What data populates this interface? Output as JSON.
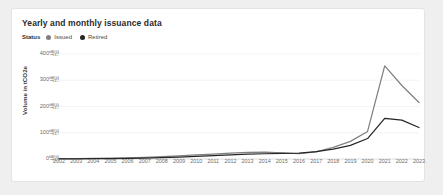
{
  "card": {
    "title": "Yearly and monthly issuance data"
  },
  "legend": {
    "title": "Status",
    "items": [
      {
        "label": "Issued",
        "color": "#808080"
      },
      {
        "label": "Retired",
        "color": "#262626"
      }
    ]
  },
  "chart_data": {
    "type": "line",
    "title": "Yearly and monthly issuance data",
    "xlabel": "",
    "ylabel": "Volume in tCO2e",
    "xlim": [
      2002,
      2023
    ],
    "ylim": [
      0,
      400000000
    ],
    "grid": true,
    "legend_position": "top-left",
    "ytick_labels": [
      "0백만",
      "100백만",
      "200백만",
      "300백만",
      "400백만"
    ],
    "ytick_values": [
      0,
      100000000,
      200000000,
      300000000,
      400000000
    ],
    "categories": [
      "2002",
      "2003",
      "2004",
      "2005",
      "2006",
      "2007",
      "2008",
      "2009",
      "2010",
      "2011",
      "2012",
      "2013",
      "2014",
      "2015",
      "2016",
      "2017",
      "2018",
      "2019",
      "2020",
      "2021",
      "2022",
      "2023"
    ],
    "series": [
      {
        "name": "Issued",
        "color": "#808080",
        "values": [
          1000000,
          1500000,
          2000000,
          3000000,
          4000000,
          6000000,
          9000000,
          12000000,
          16000000,
          19000000,
          22000000,
          25000000,
          26000000,
          23000000,
          20000000,
          27000000,
          44000000,
          67000000,
          105000000,
          355000000,
          280000000,
          215000000
        ]
      },
      {
        "name": "Retired",
        "color": "#262626",
        "values": [
          500000,
          800000,
          1200000,
          1800000,
          2500000,
          3500000,
          5000000,
          7000000,
          10000000,
          13000000,
          16000000,
          19000000,
          20000000,
          21000000,
          22000000,
          28000000,
          38000000,
          52000000,
          78000000,
          155000000,
          148000000,
          120000000
        ]
      }
    ]
  }
}
